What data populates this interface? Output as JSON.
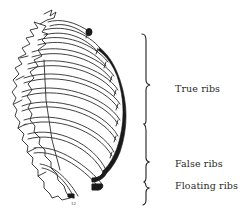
{
  "figure": {
    "labels": [
      {
        "id": "true",
        "text": "True ribs"
      },
      {
        "id": "false",
        "text": "False ribs"
      },
      {
        "id": "floating",
        "text": "Floating ribs"
      }
    ],
    "rib_count": 12,
    "numbered_rib_marker": "12",
    "colors": {
      "line": "#2b2b2b",
      "cartilage": "#1a1a1a",
      "background": "#ffffff",
      "text": "#2a2a2a"
    }
  }
}
